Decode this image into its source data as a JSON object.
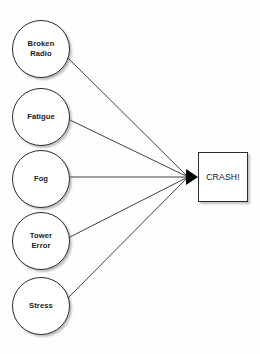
{
  "diagram": {
    "type": "cause-and-effect",
    "background_color": "#fefefe",
    "stroke_color": "#2b2b2b",
    "arrow_color": "#000000",
    "shadow_color": "#787878",
    "canvas": {
      "width": 260,
      "height": 354
    },
    "causes": [
      {
        "id": "broken-radio",
        "label": "Broken\nRadio",
        "shape": "circle",
        "x": 12,
        "y": 20,
        "diameter": 58,
        "edge_from": {
          "x": 68,
          "y": 58
        }
      },
      {
        "id": "fatigue",
        "label": "Fatigue",
        "shape": "circle",
        "x": 12,
        "y": 88,
        "diameter": 58,
        "edge_from": {
          "x": 70,
          "y": 120
        }
      },
      {
        "id": "fog",
        "label": "Fog",
        "shape": "circle",
        "x": 12,
        "y": 150,
        "diameter": 58,
        "edge_from": {
          "x": 70,
          "y": 177
        }
      },
      {
        "id": "tower-error",
        "label": "Tower\nError",
        "shape": "circle",
        "x": 12,
        "y": 212,
        "diameter": 58,
        "edge_from": {
          "x": 68,
          "y": 238
        }
      },
      {
        "id": "stress",
        "label": "Stress",
        "shape": "circle",
        "x": 12,
        "y": 277,
        "diameter": 58,
        "edge_from": {
          "x": 66,
          "y": 300
        }
      }
    ],
    "effect": {
      "id": "crash",
      "label": "CRASH!",
      "shape": "rectangle",
      "x": 198,
      "y": 152,
      "width": 50,
      "height": 50
    },
    "arrowhead": {
      "tip": {
        "x": 198,
        "y": 177
      },
      "back_x": 186,
      "half_height": 8
    }
  }
}
